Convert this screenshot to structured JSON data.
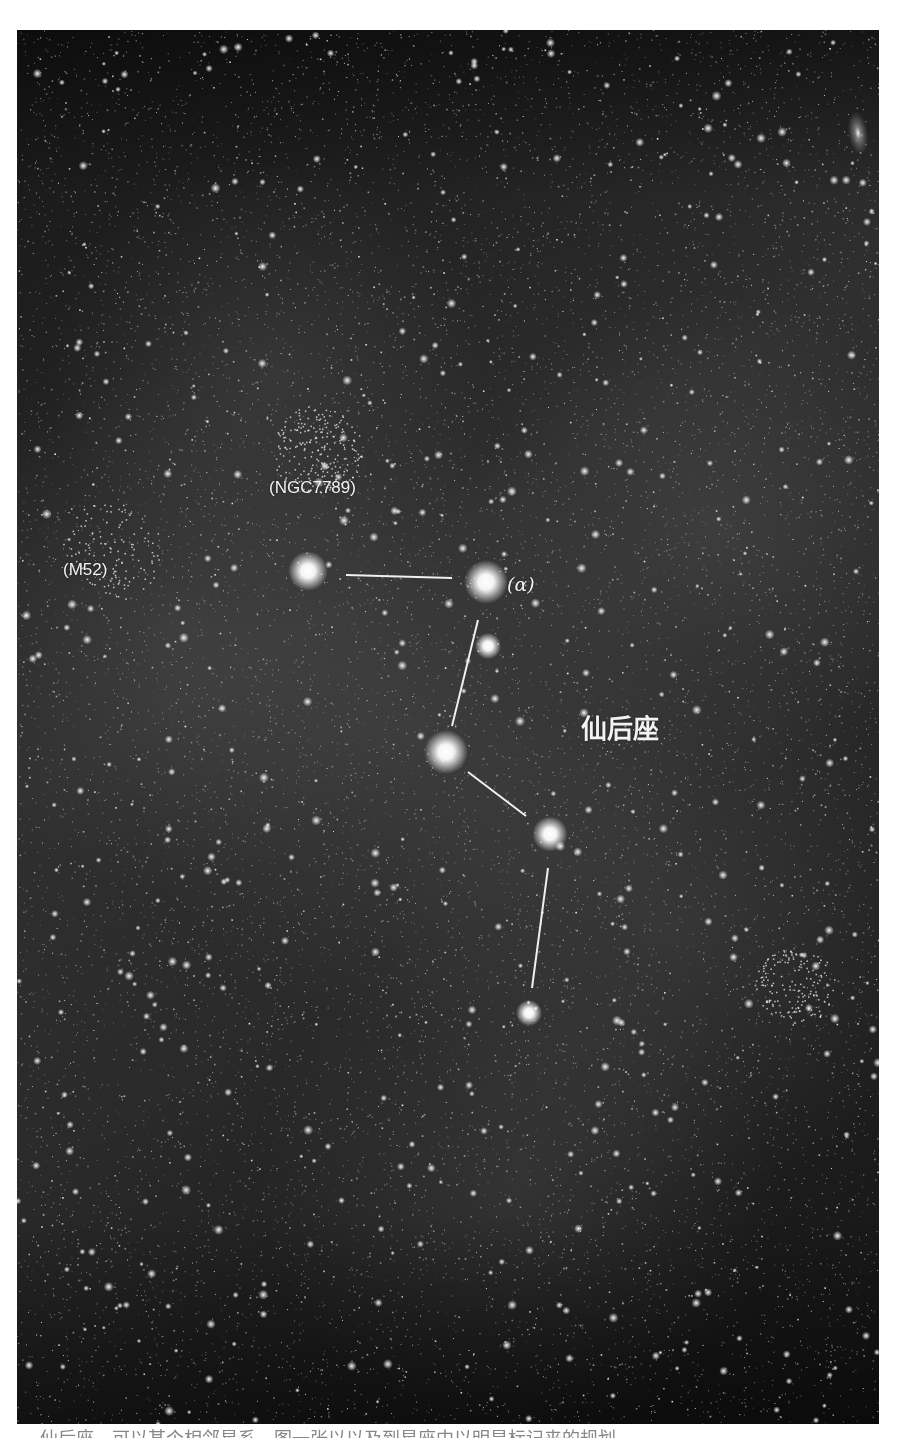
{
  "image": {
    "subject": "Cassiopeia constellation star field",
    "background_color": "#141414",
    "line_color": "#f0f0f0"
  },
  "labels": {
    "ngc7789": "(NGC7789)",
    "m52": "(M52)",
    "alpha": "(α)",
    "constellation": "仙后座"
  },
  "stars": [
    {
      "name": "star-epsilon",
      "x": 291,
      "y": 541,
      "r": 9
    },
    {
      "name": "star-alpha",
      "x": 469,
      "y": 552,
      "r": 10
    },
    {
      "name": "star-eta",
      "x": 471,
      "y": 616,
      "r": 6
    },
    {
      "name": "star-gamma",
      "x": 429,
      "y": 722,
      "r": 10
    },
    {
      "name": "star-delta",
      "x": 533,
      "y": 804,
      "r": 8
    },
    {
      "name": "star-epsilon2",
      "x": 512,
      "y": 983,
      "r": 6
    }
  ],
  "lines": [
    {
      "x1": 329,
      "y1": 545,
      "x2": 435,
      "y2": 548
    },
    {
      "x1": 461,
      "y1": 590,
      "x2": 435,
      "y2": 696
    },
    {
      "x1": 451,
      "y1": 742,
      "x2": 509,
      "y2": 786
    },
    {
      "x1": 531,
      "y1": 838,
      "x2": 515,
      "y2": 958
    }
  ],
  "caption": "仙后座、可以某个相邻星系，图一张以以及到星座中以明显标记来的规划"
}
